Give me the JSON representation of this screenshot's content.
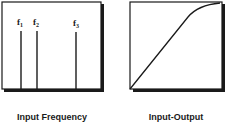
{
  "panels": [
    {
      "id": "input-frequency",
      "caption": "Input Frequency",
      "lines": [
        {
          "label": "f",
          "sub": "1",
          "x": 21
        },
        {
          "label": "f",
          "sub": "2",
          "x": 37
        },
        {
          "label": "f",
          "sub": "3",
          "x": 76
        }
      ]
    },
    {
      "id": "input-output",
      "caption": "Input-Output",
      "curve": "linear rise with saturation near top"
    }
  ],
  "colors": {
    "stroke": "#1a1a1a",
    "background": "#ffffff"
  }
}
